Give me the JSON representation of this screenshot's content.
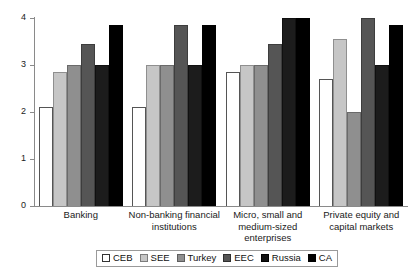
{
  "chart_data": {
    "type": "bar",
    "title": "",
    "subtitle": "",
    "xlabel": "",
    "ylabel": "",
    "ylim": [
      0,
      4
    ],
    "yticks": [
      0,
      1,
      2,
      3,
      4
    ],
    "ytick_labels": [
      "0",
      "1",
      "2",
      "3",
      "4"
    ],
    "grid": false,
    "legend_position": "bottom",
    "categories": [
      "Banking",
      "Non-banking financial institutions",
      "Micro, small and medium-sized enterprises",
      "Private equity and capital markets"
    ],
    "category_label_lines": [
      [
        "Banking"
      ],
      [
        "Non-banking financial",
        "institutions"
      ],
      [
        "Micro, small and",
        "medium-sized enterprises"
      ],
      [
        "Private equity and",
        "capital markets"
      ]
    ],
    "series": [
      {
        "name": "CEB",
        "color": "#ffffff",
        "values": [
          2.1,
          2.1,
          2.85,
          2.7
        ]
      },
      {
        "name": "SEE",
        "color": "#c6c6c6",
        "values": [
          2.85,
          3.0,
          3.0,
          3.55
        ]
      },
      {
        "name": "Turkey",
        "color": "#8f8f8f",
        "values": [
          3.0,
          3.0,
          3.0,
          2.0
        ]
      },
      {
        "name": "EEC",
        "color": "#555555",
        "values": [
          3.45,
          3.85,
          3.45,
          4.0
        ]
      },
      {
        "name": "Russia",
        "color": "#1c1c1c",
        "values": [
          3.0,
          3.0,
          4.0,
          3.0
        ]
      },
      {
        "name": "CA",
        "color": "#000000",
        "values": [
          3.85,
          3.85,
          4.0,
          3.85
        ]
      }
    ]
  },
  "legend": {
    "items": [
      {
        "label": "CEB"
      },
      {
        "label": "SEE"
      },
      {
        "label": "Turkey"
      },
      {
        "label": "EEC"
      },
      {
        "label": "Russia"
      },
      {
        "label": "CA"
      }
    ]
  }
}
